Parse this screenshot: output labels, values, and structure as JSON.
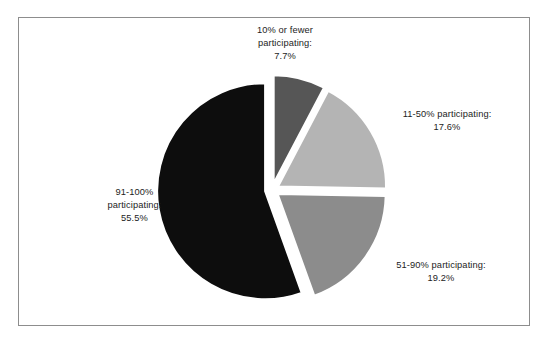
{
  "figure": {
    "background_color": "#ffffff",
    "frame_color": "#8d8d8d",
    "text_color": "#1d1d1d"
  },
  "chart_data": {
    "type": "pie",
    "title": "",
    "subtitle": "",
    "xlabel": "",
    "ylabel": "",
    "legend_position": "none",
    "grid": false,
    "exploded": true,
    "start_angle_clock": "12 o'clock",
    "direction": "clockwise",
    "total": 100.0,
    "units": "percent",
    "categories": [
      "10% or fewer participating",
      "11-50% participating",
      "51-90% participating",
      "91-100% participating"
    ],
    "values": [
      7.7,
      17.6,
      19.2,
      55.5
    ],
    "colors": [
      "#565656",
      "#b4b4b4",
      "#8c8c8c",
      "#0d0d0d"
    ],
    "slices": [
      {
        "category": "10% or fewer participating",
        "value": 7.7,
        "value_label": "7.7%",
        "color": "#565656",
        "label_line1": "10% or fewer",
        "label_line2": "participating:",
        "label_line3": "7.7%"
      },
      {
        "category": "11-50% participating",
        "value": 17.6,
        "value_label": "17.6%",
        "color": "#b4b4b4",
        "label_line1": "11-50% participating:",
        "label_line2": "17.6%",
        "label_line3": ""
      },
      {
        "category": "51-90% participating",
        "value": 19.2,
        "value_label": "19.2%",
        "color": "#8c8c8c",
        "label_line1": "51-90% participating:",
        "label_line2": "19.2%",
        "label_line3": ""
      },
      {
        "category": "91-100% participating",
        "value": 55.5,
        "value_label": "55.5%",
        "color": "#0d0d0d",
        "label_line1": "91-100%",
        "label_line2": "participating:",
        "label_line3": "55.5%"
      }
    ]
  }
}
